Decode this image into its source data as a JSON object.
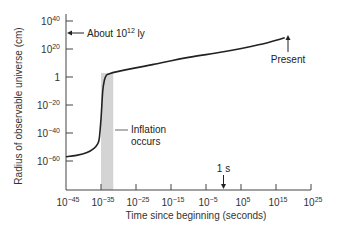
{
  "chart_data": {
    "type": "line",
    "title": "",
    "xlabel": "Time since beginning (seconds)",
    "ylabel": "Radius of observable universe (cm)",
    "x_scale": "log",
    "y_scale": "log",
    "xlim_exp": [
      -45,
      25
    ],
    "ylim_exp": [
      -70,
      40
    ],
    "x_ticks": [
      {
        "base": "10",
        "exp": "−45",
        "value_exp": -45
      },
      {
        "base": "10",
        "exp": "−35",
        "value_exp": -35
      },
      {
        "base": "10",
        "exp": "−25",
        "value_exp": -25
      },
      {
        "base": "10",
        "exp": "−15",
        "value_exp": -15
      },
      {
        "base": "10",
        "exp": "−5",
        "value_exp": -5
      },
      {
        "base": "10",
        "exp": "5",
        "value_exp": 5
      },
      {
        "base": "10",
        "exp": "15",
        "value_exp": 15
      },
      {
        "base": "10",
        "exp": "25",
        "value_exp": 25
      }
    ],
    "y_ticks": [
      {
        "base": "10",
        "exp": "40",
        "value_exp": 40
      },
      {
        "base": "10",
        "exp": "20",
        "value_exp": 20
      },
      {
        "base": "1",
        "exp": "",
        "value_exp": 0
      },
      {
        "base": "10",
        "exp": "−20",
        "value_exp": -20
      },
      {
        "base": "10",
        "exp": "−40",
        "value_exp": -40
      },
      {
        "base": "10",
        "exp": "−60",
        "value_exp": -60
      }
    ],
    "series": [
      {
        "name": "Radius of observable universe",
        "x_exp": [
          -45,
          -42,
          -39,
          -37,
          -36,
          -35.5,
          -35,
          -34.5,
          -34,
          -33.5,
          -33,
          -30,
          -20,
          -10,
          0,
          10,
          17.5
        ],
        "y_exp": [
          -57,
          -56,
          -54,
          -51,
          -48,
          -44,
          -30,
          -10,
          -2,
          1,
          2,
          4,
          9,
          14,
          18,
          23,
          28
        ]
      }
    ],
    "shaded_region": {
      "label": "Inflation",
      "x_exp": [
        -35,
        -31.5
      ]
    },
    "annotations": [
      {
        "text": "About 10",
        "sup": "12",
        "suffix": " ly",
        "target": "y-axis",
        "y_exp": 31
      },
      {
        "text": "Present",
        "target": "curve-end",
        "x_exp": 17.5,
        "y_exp": 28
      },
      {
        "text": "Inflation",
        "text2": "occurs",
        "target": "shaded-region"
      },
      {
        "text": "1 s",
        "target": "x-axis",
        "x_exp": 0
      }
    ],
    "grid": false,
    "legend": null
  },
  "colors": {
    "line": "#222222",
    "shade": "#d4d4d4",
    "axis": "#444444"
  }
}
